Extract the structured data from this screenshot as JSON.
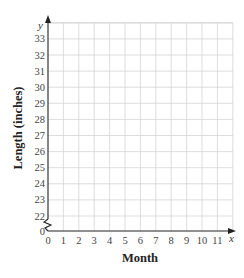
{
  "chart_data": {
    "type": "line",
    "title": "",
    "xlabel": "Month",
    "ylabel": "Length (inches)",
    "x_axis_var": "x",
    "y_axis_var": "y",
    "x_ticks": [
      "0",
      "1",
      "2",
      "3",
      "4",
      "5",
      "6",
      "7",
      "8",
      "9",
      "10",
      "11"
    ],
    "y_ticks": [
      "0",
      "22",
      "23",
      "24",
      "25",
      "26",
      "27",
      "28",
      "29",
      "30",
      "31",
      "32",
      "33"
    ],
    "xlim": [
      0,
      12
    ],
    "ylim": [
      21,
      34
    ],
    "y_axis_break": true,
    "grid": true,
    "series": []
  },
  "colors": {
    "grid": "#d4d4d4",
    "axis": "#222222"
  }
}
